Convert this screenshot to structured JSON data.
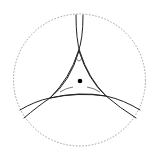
{
  "diagram": {
    "type": "geometric-construction",
    "colors": {
      "background": "#ffffff",
      "stroke": "#222222",
      "boundary": "#888888",
      "center_point": "#000000"
    },
    "boundary_circle": {
      "cx": 79.5,
      "cy": 80,
      "r": 66,
      "style": "dashed"
    },
    "center_point": {
      "cx": 80,
      "cy": 81,
      "r": 2.3
    },
    "vertices": [
      {
        "name": "top",
        "x": 79,
        "y": 51
      },
      {
        "name": "bottom-left",
        "x": 50,
        "y": 98
      },
      {
        "name": "bottom-right",
        "x": 106,
        "y": 96
      }
    ]
  }
}
